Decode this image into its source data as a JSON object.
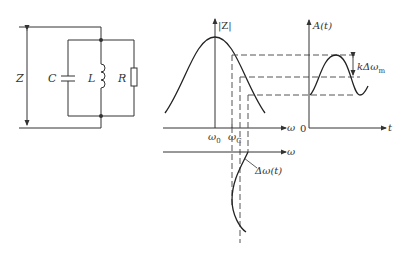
{
  "figure": {
    "colors": {
      "line": "#333333",
      "dash": "#555555",
      "background": "#ffffff"
    }
  },
  "circuit": {
    "impedance_label": "Z",
    "capacitor_label": "C",
    "inductor_label": "L",
    "resistor_label": "R"
  },
  "impedance_plot": {
    "y_axis_label": "|Z|",
    "x_axis_label": "ω",
    "tick_resonance": "ω",
    "tick_resonance_sub": "0",
    "tick_carrier": "ω",
    "tick_carrier_sub": "C"
  },
  "frequency_plot": {
    "x_axis_label": "ω",
    "curve_label": "Δω(t)"
  },
  "amplitude_plot": {
    "y_axis_label": "A(t)",
    "x_axis_label": "t",
    "origin_label": "0",
    "amplitude_annotation": "kΔω",
    "amplitude_annotation_sub": "m"
  }
}
